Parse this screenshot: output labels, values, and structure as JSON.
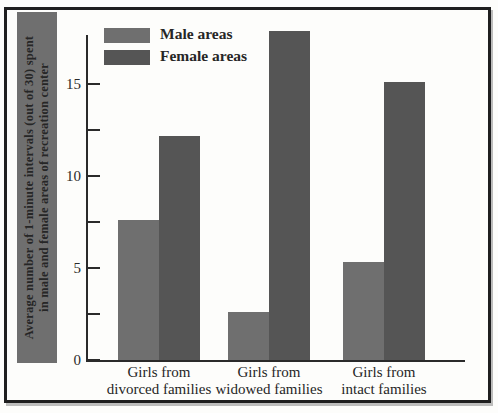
{
  "figure": {
    "background": "#fdfdfb",
    "frame_color": "#1f1f1f",
    "axis_color": "#2a2a2a"
  },
  "legend": {
    "items": [
      {
        "label": "Male areas",
        "color": "#6f6f6f"
      },
      {
        "label": "Female areas",
        "color": "#555555"
      }
    ]
  },
  "y_axis": {
    "label_lines": [
      "Average number of 1-minute intervals (out of 30) spent",
      "in male and female areas of recreation center"
    ],
    "strip_background": "#6f6f6f"
  },
  "chart_data": {
    "type": "bar",
    "categories": [
      "Girls from divorced families",
      "Girls from widowed families",
      "Girls from intact families"
    ],
    "category_label_lines": [
      [
        "Girls from",
        "divorced families"
      ],
      [
        "Girls from",
        "widowed families"
      ],
      [
        "Girls from",
        "intact families"
      ]
    ],
    "series": [
      {
        "name": "Male areas",
        "values": [
          7.6,
          2.6,
          5.3
        ],
        "color": "#6f6f6f"
      },
      {
        "name": "Female areas",
        "values": [
          12.2,
          17.9,
          15.1
        ],
        "color": "#555555"
      }
    ],
    "title": "",
    "xlabel": "",
    "ylabel": "Average number of 1-minute intervals (out of 30) spent in male and female areas of recreation center",
    "ylim": [
      0,
      17.75
    ],
    "yticks_major": [
      0,
      5,
      10,
      15
    ],
    "yticks_minor": [
      2.5,
      7.5,
      12.5
    ],
    "grid": false,
    "legend_position": "upper-left"
  }
}
